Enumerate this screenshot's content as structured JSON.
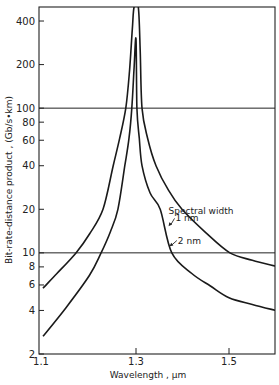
{
  "chart_data": {
    "type": "line",
    "title": "",
    "xlabel": "Wavelength , µm",
    "ylabel": "Bit-rate-distance product , (Gb/s•km)",
    "x_scale": "linear",
    "y_scale": "log",
    "xlim": [
      1.1,
      1.6
    ],
    "ylim": [
      2,
      500
    ],
    "x_ticks": [
      1.1,
      1.3,
      1.5
    ],
    "x_tick_labels": [
      "1.1",
      "1.3",
      "1.5"
    ],
    "y_ticks": [
      2,
      4,
      6,
      8,
      10,
      20,
      40,
      60,
      80,
      100,
      200,
      400
    ],
    "y_tick_labels": [
      "2",
      "4",
      "6",
      "8",
      "10",
      "20",
      "40",
      "60",
      "80",
      "100",
      "200",
      "400"
    ],
    "reference_lines": [
      10,
      100
    ],
    "grid": false,
    "legend": null,
    "annotations": [
      {
        "text": "Spectral width",
        "x": 1.37,
        "y": 18.5
      },
      {
        "text": "1 nm",
        "x": 1.385,
        "y": 16.5,
        "arrow_to": [
          1.37,
          15.3
        ]
      },
      {
        "text": "2 nm",
        "x": 1.39,
        "y": 11.6,
        "arrow_to": [
          1.372,
          11.1
        ]
      }
    ],
    "series": [
      {
        "name": "1 nm",
        "x": [
          1.1,
          1.13,
          1.171,
          1.2,
          1.229,
          1.251,
          1.265,
          1.278,
          1.286,
          1.292,
          1.296,
          1.305,
          1.309,
          1.313,
          1.325,
          1.343,
          1.37,
          1.399,
          1.45,
          1.502,
          1.55,
          1.6
        ],
        "values": [
          5.7,
          7.2,
          10,
          13.5,
          20,
          40,
          62,
          100,
          180,
          350,
          500,
          500,
          250,
          100,
          62,
          40,
          27,
          20,
          13.8,
          10,
          8.9,
          8.1
        ]
      },
      {
        "name": "2 nm",
        "x": [
          1.1,
          1.15,
          1.2,
          1.225,
          1.245,
          1.261,
          1.276,
          1.285,
          1.291,
          1.296,
          1.3,
          1.302,
          1.307,
          1.313,
          1.33,
          1.352,
          1.377,
          1.42,
          1.46,
          1.5,
          1.55,
          1.6
        ],
        "values": [
          2.65,
          4.2,
          7.0,
          10,
          14,
          20,
          40,
          62,
          100,
          190,
          300,
          100,
          62,
          40,
          26,
          20,
          10,
          7.2,
          5.9,
          4.9,
          4.4,
          4.0
        ]
      }
    ]
  }
}
